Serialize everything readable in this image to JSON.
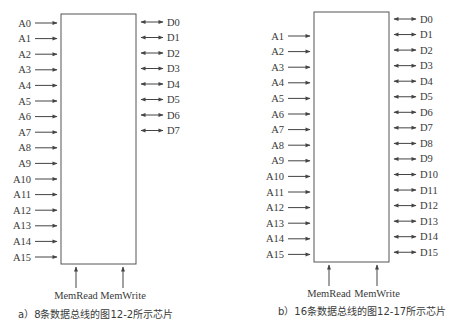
{
  "diagrams": [
    {
      "id": "a",
      "caption": "a）8条数据总线的图12-2所示芯片",
      "address_lines": [
        "A0",
        "A1",
        "A2",
        "A3",
        "A4",
        "A5",
        "A6",
        "A7",
        "A8",
        "A9",
        "A10",
        "A11",
        "A12",
        "A13",
        "A14",
        "A15"
      ],
      "data_lines": [
        "D0",
        "D1",
        "D2",
        "D3",
        "D4",
        "D5",
        "D6",
        "D7"
      ],
      "control_lines": [
        "MemRead",
        "MemWrite"
      ]
    },
    {
      "id": "b",
      "caption": "b）16条数据总线的图12-17所示芯片",
      "address_lines": [
        "A1",
        "A2",
        "A3",
        "A4",
        "A5",
        "A6",
        "A7",
        "A8",
        "A9",
        "A10",
        "A11",
        "A12",
        "A13",
        "A14",
        "A15"
      ],
      "data_lines": [
        "D0",
        "D1",
        "D2",
        "D3",
        "D4",
        "D5",
        "D6",
        "D7",
        "D8",
        "D9",
        "D10",
        "D11",
        "D12",
        "D13",
        "D14",
        "D15"
      ],
      "control_lines": [
        "MemRead",
        "MemWrite"
      ]
    }
  ],
  "colors": {
    "line": "#555555",
    "text": "#3a3a3a",
    "background": "#ffffff"
  }
}
